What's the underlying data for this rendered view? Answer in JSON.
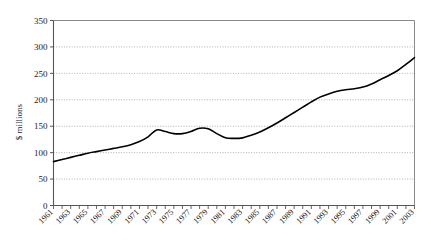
{
  "chart_data": {
    "type": "line",
    "title": "",
    "subtitle": "",
    "xlabel": "",
    "ylabel": "$ millions",
    "ylim": [
      0,
      350
    ],
    "xlim": [
      1961,
      2003
    ],
    "grid": true,
    "legend": false,
    "legend_position": "none",
    "line_color": "#000000",
    "y_ticks": [
      0,
      50,
      100,
      150,
      200,
      250,
      300,
      350
    ],
    "y_tick_labels": [
      "0",
      "50",
      "100",
      "150",
      "200",
      "250",
      "300",
      "350"
    ],
    "x_tick_labels": [
      "1961",
      "1963",
      "1965",
      "1967",
      "1969",
      "1971",
      "1973",
      "1975",
      "1977",
      "1979",
      "1981",
      "1983",
      "1985",
      "1987",
      "1989",
      "1991",
      "1993",
      "1995",
      "1997",
      "1999",
      "2001",
      "2003"
    ],
    "x_minor_tick_every": 1,
    "x": [
      1961,
      1962,
      1963,
      1964,
      1965,
      1966,
      1967,
      1968,
      1969,
      1970,
      1971,
      1972,
      1973,
      1974,
      1975,
      1976,
      1977,
      1978,
      1979,
      1980,
      1981,
      1982,
      1983,
      1984,
      1985,
      1986,
      1987,
      1988,
      1989,
      1990,
      1991,
      1992,
      1993,
      1994,
      1995,
      1996,
      1997,
      1998,
      1999,
      2000,
      2001,
      2002,
      2003
    ],
    "values": [
      83,
      87,
      91,
      95,
      99,
      102,
      105,
      108,
      111,
      115,
      121,
      130,
      143,
      140,
      136,
      136,
      140,
      146,
      145,
      136,
      128,
      127,
      128,
      133,
      139,
      147,
      156,
      166,
      176,
      186,
      196,
      205,
      211,
      216,
      219,
      221,
      224,
      230,
      238,
      246,
      255,
      267,
      280
    ],
    "series": [
      {
        "name": "$ millions",
        "values": [
          83,
          87,
          91,
          95,
          99,
          102,
          105,
          108,
          111,
          115,
          121,
          130,
          143,
          140,
          136,
          136,
          140,
          146,
          145,
          136,
          128,
          127,
          128,
          133,
          139,
          147,
          156,
          166,
          176,
          186,
          196,
          205,
          211,
          216,
          219,
          221,
          224,
          230,
          238,
          246,
          255,
          267,
          280
        ]
      }
    ]
  }
}
